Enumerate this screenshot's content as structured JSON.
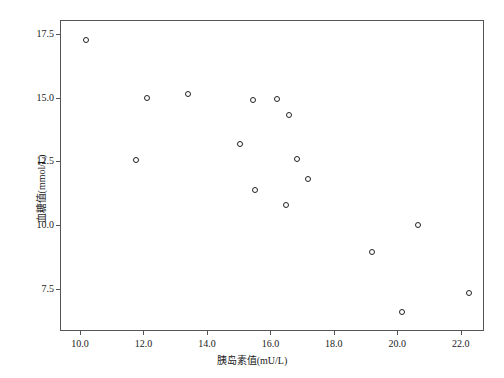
{
  "chart_data": {
    "type": "scatter",
    "title": "",
    "xlabel": "胰岛素值(mU/L)",
    "ylabel": "血糖值(mmol/L)",
    "xlim": [
      9.4,
      22.7
    ],
    "ylim": [
      5.9,
      18.0
    ],
    "xticks": [
      "10.0",
      "12.0",
      "14.0",
      "16.0",
      "18.0",
      "20.0",
      "22.0"
    ],
    "xtick_values": [
      10.0,
      12.0,
      14.0,
      16.0,
      18.0,
      20.0,
      22.0
    ],
    "yticks": [
      "17.5",
      "15.0",
      "12.5",
      "10.0",
      "7.5"
    ],
    "ytick_values": [
      17.5,
      15.0,
      12.5,
      10.0,
      7.5
    ],
    "grid": false,
    "legend": null,
    "marker": "open-circle",
    "marker_color": "#222222",
    "points": [
      {
        "x": 10.2,
        "y": 17.25
      },
      {
        "x": 12.1,
        "y": 15.0
      },
      {
        "x": 13.4,
        "y": 15.15
      },
      {
        "x": 11.75,
        "y": 12.55
      },
      {
        "x": 15.45,
        "y": 14.9
      },
      {
        "x": 16.6,
        "y": 14.3
      },
      {
        "x": 15.05,
        "y": 13.2
      },
      {
        "x": 16.85,
        "y": 12.6
      },
      {
        "x": 15.5,
        "y": 11.4
      },
      {
        "x": 17.2,
        "y": 11.8
      },
      {
        "x": 16.5,
        "y": 10.8
      },
      {
        "x": 20.65,
        "y": 10.0
      },
      {
        "x": 19.2,
        "y": 8.95
      },
      {
        "x": 22.25,
        "y": 7.35
      },
      {
        "x": 20.15,
        "y": 6.6
      },
      {
        "x": 16.2,
        "y": 14.95
      }
    ]
  }
}
